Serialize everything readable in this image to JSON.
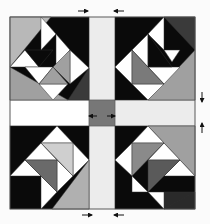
{
  "colors": {
    "background": "#fbfbfb",
    "black": "#0a0a0a",
    "dark": "#2a2a2a",
    "medium": "#7a7a7a",
    "light": "#a8a8a8",
    "pale": "#c8c8c8",
    "white": "#ffffff",
    "sash": "#ececec",
    "center": "#777777",
    "stroke": "#333333"
  },
  "arrows": [
    {
      "name": "arrow-top-left",
      "x1": 78,
      "y1": 11,
      "x2": 88,
      "y2": 11
    },
    {
      "name": "arrow-top-right",
      "x1": 124,
      "y1": 11,
      "x2": 114,
      "y2": 11
    },
    {
      "name": "arrow-bottom-left",
      "x1": 82,
      "y1": 215,
      "x2": 92,
      "y2": 215
    },
    {
      "name": "arrow-bottom-right",
      "x1": 124,
      "y1": 215,
      "x2": 114,
      "y2": 215
    },
    {
      "name": "arrow-right-top",
      "x1": 202,
      "y1": 92,
      "x2": 202,
      "y2": 102
    },
    {
      "name": "arrow-right-bottom",
      "x1": 202,
      "y1": 133,
      "x2": 202,
      "y2": 123
    },
    {
      "name": "arrow-center-left",
      "x1": 98,
      "y1": 116,
      "x2": 88,
      "y2": 116
    },
    {
      "name": "arrow-center-right",
      "x1": 108,
      "y1": 116,
      "x2": 118,
      "y2": 116
    }
  ]
}
